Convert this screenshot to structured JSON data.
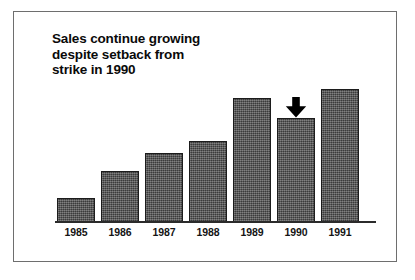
{
  "figure": {
    "background_color": "#ffffff",
    "frame_color": "#6e6e6e"
  },
  "chart_data": {
    "type": "bar",
    "title": "Sales continue growing\ndespite setback from\nstrike in 1990",
    "xlabel": "",
    "ylabel": "",
    "categories": [
      "1985",
      "1986",
      "1987",
      "1988",
      "1989",
      "1990",
      "1991"
    ],
    "values": [
      24,
      51,
      69,
      81,
      124,
      104,
      133
    ],
    "ylim": [
      0,
      142
    ],
    "grid": false,
    "legend": null,
    "bar_color": "#4f4f4f",
    "bar_edge_color": "#1c1c1c",
    "axis_color": "#2b2b2b",
    "annotations": [
      {
        "name": "down-arrow",
        "target_category": "1990",
        "shape": "solid-down-arrow",
        "color": "#000000"
      }
    ]
  },
  "ticks": {
    "labels": [
      "1985",
      "1986",
      "1987",
      "1988",
      "1989",
      "1990",
      "1991"
    ]
  }
}
